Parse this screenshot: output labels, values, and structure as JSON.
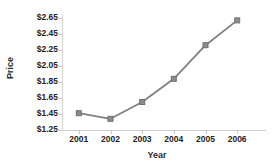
{
  "chart_data": {
    "type": "line",
    "title": "",
    "xlabel": "Year",
    "ylabel": "Price",
    "categories": [
      "2001",
      "2002",
      "2003",
      "2004",
      "2005",
      "2006"
    ],
    "values": [
      1.46,
      1.39,
      1.6,
      1.89,
      2.31,
      2.62
    ],
    "series": [
      {
        "name": "Price",
        "values": [
          1.46,
          1.39,
          1.6,
          1.89,
          2.31,
          2.62
        ]
      }
    ],
    "ylim": [
      1.25,
      2.65
    ],
    "ytick_labels": [
      "$2.65",
      "$2.45",
      "$2.25",
      "$2.05",
      "$1.85",
      "$1.65",
      "$1.45",
      "$1.25"
    ],
    "ytick_values": [
      2.65,
      2.45,
      2.25,
      2.05,
      1.85,
      1.65,
      1.45,
      1.25
    ],
    "ytick_step": 0.2,
    "xtick_labels": [
      "2001",
      "2002",
      "2003",
      "2004",
      "2005",
      "2006"
    ],
    "grid": false,
    "legend": false,
    "legend_position": "none",
    "marker": "square",
    "line_color": "#808080",
    "marker_color": "#8c8c8c",
    "marker_edge_color": "#6f6f6f",
    "background_color": "#ffffff",
    "axis_color": "#d0d0d0",
    "text_color": "#222222"
  }
}
